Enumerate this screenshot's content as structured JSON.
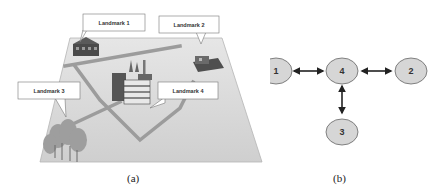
{
  "panel_a": {
    "caption": "(a)",
    "landmarks": [
      {
        "id": 1,
        "label": "Landmark 1",
        "type": "residential-building"
      },
      {
        "id": 2,
        "label": "Landmark 2",
        "type": "residential-building"
      },
      {
        "id": 3,
        "label": "Landmark 3",
        "type": "trees"
      },
      {
        "id": 4,
        "label": "Landmark 4",
        "type": "factory"
      }
    ]
  },
  "panel_b": {
    "caption": "(b)",
    "nodes": [
      {
        "id": "1",
        "label": "1"
      },
      {
        "id": "4",
        "label": "4"
      },
      {
        "id": "2",
        "label": "2"
      },
      {
        "id": "3",
        "label": "3"
      }
    ],
    "edges": [
      {
        "from": "1",
        "to": "4",
        "direction": "bidirectional"
      },
      {
        "from": "4",
        "to": "2",
        "direction": "bidirectional"
      },
      {
        "from": "4",
        "to": "3",
        "direction": "bidirectional"
      }
    ]
  },
  "colors": {
    "map_ground": "#d9d9d9",
    "road": "#9a9a9a",
    "node_fill": "#d6d6d6",
    "node_stroke": "#666666",
    "arrow": "#222222"
  }
}
